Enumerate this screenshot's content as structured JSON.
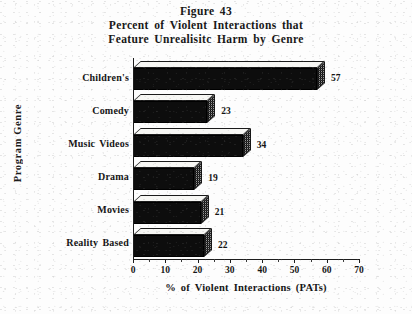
{
  "chart_data": {
    "type": "bar",
    "orientation": "horizontal",
    "title": "Figure 43",
    "subtitle_line1": "Percent of Violent Interactions that",
    "subtitle_line2": "Feature Unrealisitc Harm by Genre",
    "xlabel": "% of Violent Interactions (PATs)",
    "ylabel": "Program Genre",
    "categories": [
      "Children's",
      "Comedy",
      "Music Videos",
      "Drama",
      "Movies",
      "Reality Based"
    ],
    "values": [
      57,
      23,
      34,
      19,
      21,
      22
    ],
    "value_labels": [
      "57",
      "23",
      "34",
      "19",
      "21",
      "22"
    ],
    "xlim": [
      0,
      70
    ],
    "xticks": [
      0,
      10,
      20,
      30,
      40,
      50,
      60,
      70
    ],
    "xtick_labels": [
      "0",
      "10",
      "20",
      "30",
      "40",
      "50",
      "60",
      "70"
    ],
    "xtick_minor_step": 5,
    "grid": false,
    "legend": null,
    "style": "3d-bar",
    "colors": {
      "bar_front": "#0d0d0d",
      "bar_top": "#f7f7f4",
      "bar_side": "#9a9a9a",
      "axis": "#1d1d1d",
      "text": "#151515",
      "background": "#fdfdfd"
    }
  }
}
